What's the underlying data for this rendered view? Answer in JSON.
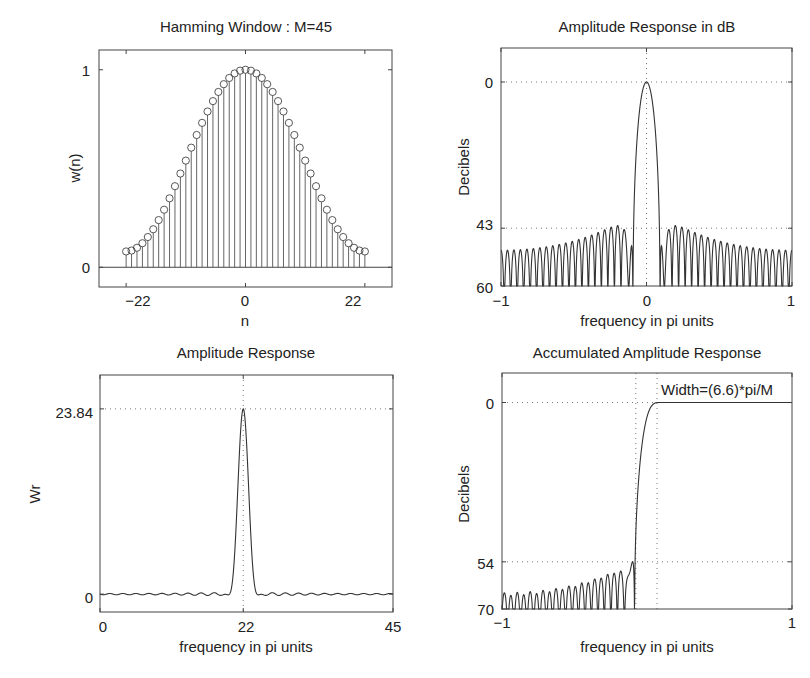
{
  "chart_data": [
    {
      "id": "hamming-window",
      "type": "stem",
      "title": "Hamming Window : M=45",
      "xlabel": "n",
      "ylabel": "w(n)",
      "xlim": [
        -27,
        27
      ],
      "ylim": [
        -0.1,
        1.1
      ],
      "xticks": [
        -22,
        0,
        22
      ],
      "xtick_labels": [
        "−22",
        "0",
        "22"
      ],
      "yticks": [
        0,
        1
      ],
      "ytick_labels": [
        "0",
        "1"
      ],
      "grid": false,
      "series": [
        {
          "name": "w(n)",
          "formula": "0.54 - 0.46*cos(2*pi*(n+22)/44)",
          "n_range": [
            -22,
            22
          ],
          "M": 45
        }
      ],
      "box": {
        "left": 99,
        "top": 50,
        "right": 392,
        "bottom": 287
      }
    },
    {
      "id": "amplitude-response-db",
      "type": "line",
      "title": "Amplitude Response in dB",
      "xlabel": "frequency in pi units",
      "ylabel": "Decibels",
      "xlim": [
        -1,
        1
      ],
      "ylim": [
        -60,
        10
      ],
      "xticks": [
        -1,
        0,
        1
      ],
      "xtick_labels": [
        "−1",
        "0",
        "1"
      ],
      "yticks": [
        0,
        -43,
        -60
      ],
      "ytick_labels": [
        "0",
        "43",
        "60"
      ],
      "grid": true,
      "grid_x": [
        0
      ],
      "grid_y": [
        0,
        -43
      ],
      "mainlobe_halfwidth": 0.0889,
      "peak_sidelobe_db": -43,
      "box": {
        "left": 501,
        "top": 48,
        "right": 792,
        "bottom": 286
      }
    },
    {
      "id": "amplitude-response",
      "type": "line",
      "title": "Amplitude Response",
      "xlabel": "frequency in pi units",
      "ylabel": "Wr",
      "xlim": [
        0,
        45
      ],
      "ylim": [
        -2.3,
        28.2
      ],
      "xticks": [
        0,
        22,
        45
      ],
      "xtick_labels": [
        "0",
        "22",
        "45"
      ],
      "yticks": [
        0,
        23.84
      ],
      "ytick_labels": [
        "0",
        "23.84"
      ],
      "grid": true,
      "grid_x": [
        22
      ],
      "grid_y": [
        23.84
      ],
      "peak": {
        "x": 22,
        "y": 23.84
      },
      "box": {
        "left": 100,
        "top": 375,
        "right": 393,
        "bottom": 612
      }
    },
    {
      "id": "accumulated-amplitude-response",
      "type": "line",
      "title": "Accumulated Amplitude Response",
      "xlabel": "frequency in pi units",
      "ylabel": "Decibels",
      "xlim": [
        -1,
        1
      ],
      "ylim": [
        -70,
        10
      ],
      "xticks": [
        -1,
        1
      ],
      "xtick_labels": [
        "−1",
        "1"
      ],
      "yticks": [
        0,
        -54,
        -70
      ],
      "ytick_labels": [
        "0",
        "54",
        "70"
      ],
      "grid": true,
      "grid_x": [
        -0.0773,
        0.0693
      ],
      "grid_y": [
        0,
        -54
      ],
      "annotation": "Width=(6.6)*pi/M",
      "box": {
        "left": 502,
        "top": 373,
        "right": 792,
        "bottom": 609
      }
    }
  ]
}
